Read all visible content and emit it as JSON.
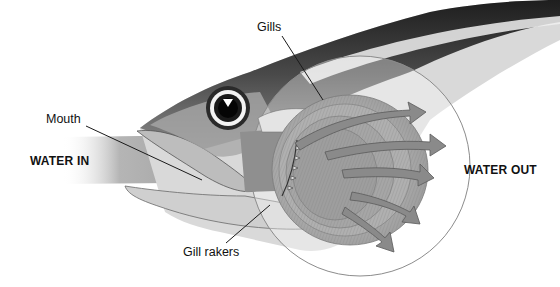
{
  "diagram": {
    "labels": {
      "gills": "Gills",
      "mouth": "Mouth",
      "water_in": "WATER IN",
      "water_out": "WATER OUT",
      "gill_rakers": "Gill rakers"
    },
    "colors": {
      "background": "#ffffff",
      "arrow_fill": "#8a8a8a",
      "arrow_stroke": "#5a5a5a",
      "water_band": "#a9a9a9",
      "head_dark": "#2e2e2e",
      "circle_outline": "#8c8c8c",
      "text": "#111111"
    },
    "arrows_out_count": 6
  }
}
